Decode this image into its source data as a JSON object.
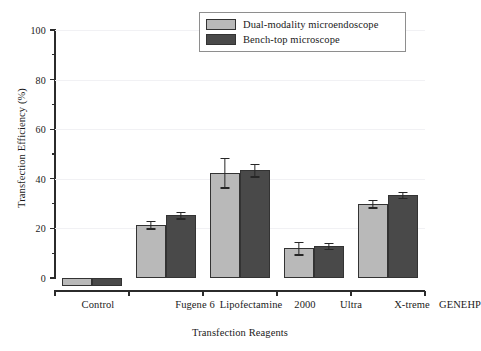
{
  "chart_data": {
    "type": "bar",
    "title": "",
    "xlabel": "Transfection Reagents",
    "ylabel": "Transfection Efficiency (%)",
    "ylim": [
      0,
      100
    ],
    "yticks": [
      0,
      20,
      40,
      60,
      80,
      100
    ],
    "yticklabels": [
      "0",
      "20",
      "40",
      "60",
      "80",
      "100"
    ],
    "yminorticks": [
      10,
      30,
      50,
      70,
      90
    ],
    "grid": "horizontal-major-faint",
    "legend_position": "top-right",
    "categories": [
      "Control",
      "Fugene 6",
      "Lipofectamine 2000",
      "Ultra",
      "X-treme GENEHP"
    ],
    "xticklabels": [
      "Control",
      "Fugene 6",
      "Lipofectamine",
      "2000",
      "Ultra",
      "X-treme",
      "GENEHP"
    ],
    "series": [
      {
        "name": "Dual-modality microendoscope",
        "color": "#b9b9b9",
        "values": [
          0,
          21.5,
          42.5,
          12.0,
          30.0
        ],
        "errors": [
          0,
          1.5,
          6.0,
          2.5,
          1.5
        ]
      },
      {
        "name": "Bench-top microscope",
        "color": "#494949",
        "values": [
          0,
          25.3,
          43.5,
          13.0,
          33.5
        ],
        "errors": [
          0,
          1.3,
          2.5,
          1.3,
          1.3
        ]
      }
    ]
  },
  "legend": {
    "entries": [
      {
        "label": "Dual-modality microendoscope"
      },
      {
        "label": "Bench-top microscope"
      }
    ]
  },
  "axes": {
    "y_title": "Transfection Efficiency (%)",
    "x_title": "Transfection Reagents"
  },
  "colors": {
    "series_light": "#b9b9b9",
    "series_dark": "#494949",
    "axis": "#2b2b2b",
    "grid": "#f1f1f4",
    "legend_border": "#8e8e8e",
    "background": "#ffffff"
  }
}
